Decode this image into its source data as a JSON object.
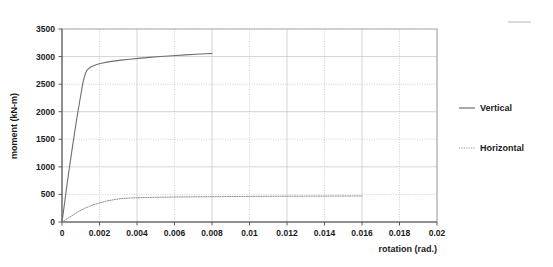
{
  "chart_data": {
    "type": "line",
    "title": "",
    "xlabel": "rotation (rad.)",
    "ylabel": "moment (kN-m)",
    "xlim": [
      0,
      0.02
    ],
    "ylim": [
      0,
      3500
    ],
    "grid": true,
    "legend_position": "right",
    "xticks": [
      0,
      0.002,
      0.004,
      0.006,
      0.008,
      0.01,
      0.012,
      0.014,
      0.016,
      0.018,
      0.02
    ],
    "xtick_labels": [
      "0",
      "0.002",
      "0.004",
      "0.006",
      "0.008",
      "0.01",
      "0.012",
      "0.014",
      "0.016",
      "0.018",
      "0.02"
    ],
    "yticks": [
      0,
      500,
      1000,
      1500,
      2000,
      2500,
      3000,
      3500
    ],
    "ytick_labels": [
      "0",
      "500",
      "1000",
      "1500",
      "2000",
      "2500",
      "3000",
      "3500"
    ],
    "series": [
      {
        "name": "Vertical",
        "style": "solid",
        "color": "#6e6e6e",
        "x": [
          0.0,
          5e-05,
          0.00012,
          0.00022,
          0.00035,
          0.0005,
          0.00065,
          0.0008,
          0.00092,
          0.00102,
          0.0011,
          0.00118,
          0.00126,
          0.00135,
          0.00148,
          0.00165,
          0.00185,
          0.0021,
          0.0024,
          0.00275,
          0.00315,
          0.0036,
          0.0041,
          0.00465,
          0.00525,
          0.0059,
          0.00655,
          0.00715,
          0.00768,
          0.00798,
          0.008
        ],
        "y": [
          0,
          120,
          300,
          560,
          880,
          1230,
          1570,
          1900,
          2140,
          2340,
          2500,
          2620,
          2705,
          2760,
          2800,
          2830,
          2855,
          2880,
          2900,
          2918,
          2935,
          2952,
          2968,
          2985,
          3000,
          3015,
          3030,
          3042,
          3052,
          3058,
          3060
        ]
      },
      {
        "name": "Horizontal",
        "style": "dotted",
        "color": "#8e8e8e",
        "x": [
          0.0,
          0.00015,
          0.00035,
          0.0006,
          0.0009,
          0.00125,
          0.00165,
          0.00205,
          0.00245,
          0.00285,
          0.0032,
          0.0036,
          0.0042,
          0.005,
          0.006,
          0.0072,
          0.0086,
          0.01,
          0.0115,
          0.013,
          0.0145,
          0.016
        ],
        "y": [
          0,
          30,
          75,
          130,
          195,
          255,
          310,
          350,
          385,
          410,
          425,
          435,
          442,
          448,
          453,
          457,
          461,
          464,
          467,
          469,
          471,
          472
        ]
      }
    ]
  },
  "legend": {
    "items": [
      {
        "label": "Vertical",
        "style": "solid"
      },
      {
        "label": "Horizontal",
        "style": "dotted"
      }
    ]
  }
}
